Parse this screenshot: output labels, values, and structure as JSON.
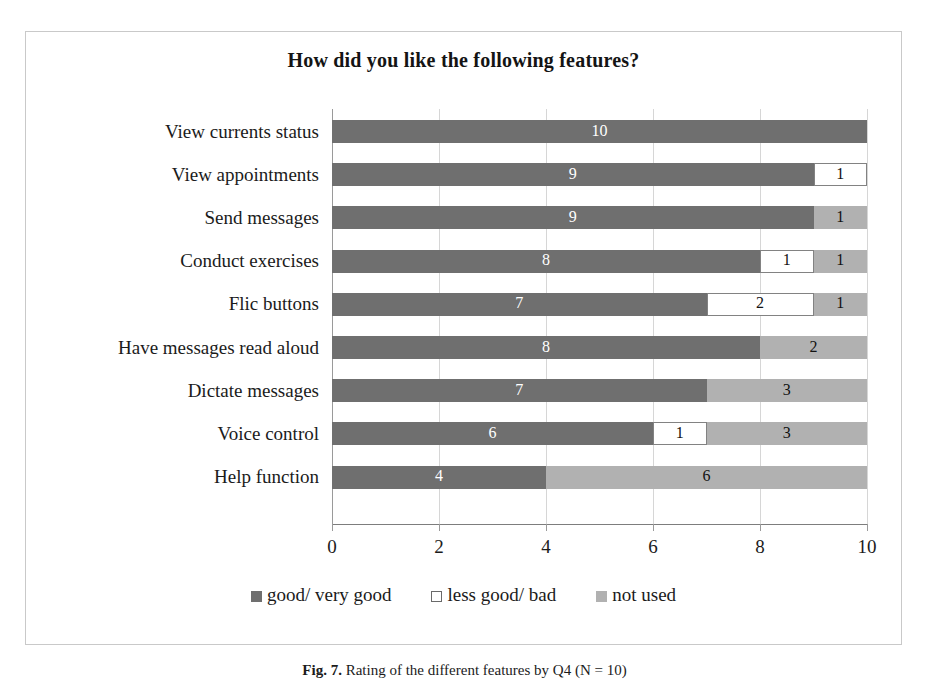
{
  "chart_data": {
    "type": "bar",
    "orientation": "horizontal",
    "stacked": true,
    "title": "How did you like the following features?",
    "xlabel": "",
    "ylabel": "",
    "xlim": [
      0,
      10
    ],
    "xticks": [
      0,
      2,
      4,
      6,
      8,
      10
    ],
    "xtick_labels": [
      "0",
      "2",
      "4",
      "6",
      "8",
      "10"
    ],
    "grid": "vertical",
    "legend_position": "bottom",
    "legend": [
      "good/ very good",
      "less good/ bad",
      "not used"
    ],
    "categories": [
      "View currents status",
      "View appointments",
      "Send messages",
      "Conduct exercises",
      "Flic buttons",
      "Have messages read aloud",
      "Dictate messages",
      "Voice control",
      "Help function"
    ],
    "series": [
      {
        "name": "good/ very good",
        "color": "#6f6f6f",
        "values": [
          10,
          9,
          9,
          8,
          7,
          8,
          7,
          6,
          4
        ]
      },
      {
        "name": "less good/ bad",
        "color": "#ffffff",
        "values": [
          0,
          1,
          0,
          1,
          2,
          0,
          0,
          1,
          0
        ]
      },
      {
        "name": "not used",
        "color": "#b1b1b1",
        "values": [
          0,
          0,
          1,
          1,
          1,
          2,
          3,
          3,
          6
        ]
      }
    ],
    "rows": [
      {
        "label": "View currents status",
        "segments": [
          {
            "series": "good",
            "value": 10,
            "label": "10"
          }
        ]
      },
      {
        "label": "View appointments",
        "segments": [
          {
            "series": "good",
            "value": 9,
            "label": "9"
          },
          {
            "series": "bad",
            "value": 1,
            "label": "1"
          }
        ]
      },
      {
        "label": "Send messages",
        "segments": [
          {
            "series": "good",
            "value": 9,
            "label": "9"
          },
          {
            "series": "unused",
            "value": 1,
            "label": "1"
          }
        ]
      },
      {
        "label": "Conduct exercises",
        "segments": [
          {
            "series": "good",
            "value": 8,
            "label": "8"
          },
          {
            "series": "bad",
            "value": 1,
            "label": "1"
          },
          {
            "series": "unused",
            "value": 1,
            "label": "1"
          }
        ]
      },
      {
        "label": "Flic buttons",
        "segments": [
          {
            "series": "good",
            "value": 7,
            "label": "7"
          },
          {
            "series": "bad",
            "value": 2,
            "label": "2"
          },
          {
            "series": "unused",
            "value": 1,
            "label": "1"
          }
        ]
      },
      {
        "label": "Have messages read aloud",
        "segments": [
          {
            "series": "good",
            "value": 8,
            "label": "8"
          },
          {
            "series": "unused",
            "value": 2,
            "label": "2"
          }
        ]
      },
      {
        "label": "Dictate messages",
        "segments": [
          {
            "series": "good",
            "value": 7,
            "label": "7"
          },
          {
            "series": "unused",
            "value": 3,
            "label": "3"
          }
        ]
      },
      {
        "label": "Voice control",
        "segments": [
          {
            "series": "good",
            "value": 6,
            "label": "6"
          },
          {
            "series": "bad",
            "value": 1,
            "label": "1"
          },
          {
            "series": "unused",
            "value": 3,
            "label": "3"
          }
        ]
      },
      {
        "label": "Help function",
        "segments": [
          {
            "series": "good",
            "value": 4,
            "label": "4"
          },
          {
            "series": "unused",
            "value": 6,
            "label": "6"
          }
        ]
      }
    ]
  },
  "caption": {
    "number": "Fig. 7.",
    "text": "Rating of the different features by Q4 (N = 10)"
  },
  "colors": {
    "good": "#6f6f6f",
    "bad": "#ffffff",
    "unused": "#b1b1b1",
    "grid": "#d6d6d6",
    "frame": "#c9c9c9"
  }
}
